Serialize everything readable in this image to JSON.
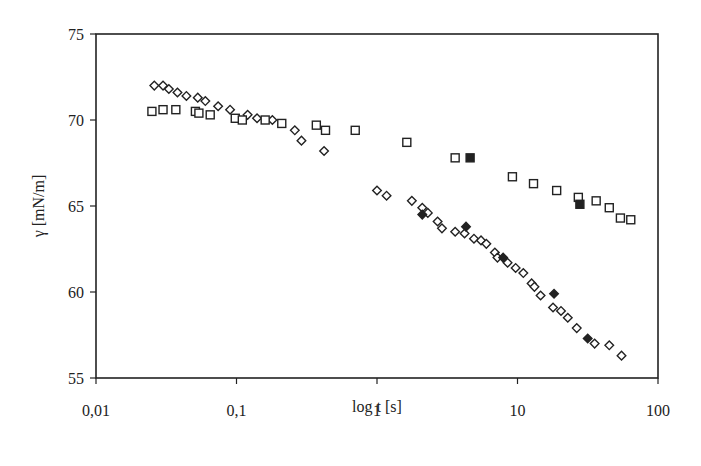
{
  "chart_data": {
    "type": "scatter",
    "title": "",
    "xlabel": "log t [s]",
    "ylabel": "γ [mN/m]",
    "xscale": "log",
    "xlim": [
      0.01,
      100
    ],
    "ylim": [
      55,
      75
    ],
    "x_ticks": [
      0.01,
      0.1,
      1,
      10,
      100
    ],
    "x_tick_labels": [
      "0,01",
      "0,1",
      "1",
      "10",
      "100"
    ],
    "y_ticks": [
      55,
      60,
      65,
      70,
      75
    ],
    "y_tick_labels": [
      "55",
      "60",
      "65",
      "70",
      "75"
    ],
    "grid": false,
    "legend": null,
    "series": [
      {
        "name": "open diamonds",
        "marker": "diamond-open",
        "x": [
          0.026,
          0.03,
          0.033,
          0.038,
          0.044,
          0.053,
          0.06,
          0.074,
          0.09,
          0.12,
          0.14,
          0.18,
          0.26,
          0.29,
          0.42,
          1.0,
          1.17,
          1.77,
          2.1,
          2.3,
          2.7,
          2.9,
          3.6,
          4.2,
          4.9,
          5.5,
          6.0,
          6.9,
          7.2,
          8.5,
          9.7,
          11.0,
          12.6,
          13.2,
          14.6,
          17.9,
          20.4,
          22.8,
          26.4,
          35.4,
          45,
          55
        ],
        "y": [
          72.0,
          72.0,
          71.8,
          71.6,
          71.4,
          71.3,
          71.1,
          70.8,
          70.6,
          70.3,
          70.1,
          70.0,
          69.4,
          68.8,
          68.2,
          65.9,
          65.6,
          65.3,
          64.9,
          64.6,
          64.1,
          63.7,
          63.5,
          63.4,
          63.1,
          63.0,
          62.8,
          62.3,
          62.0,
          61.7,
          61.4,
          61.1,
          60.5,
          60.3,
          59.8,
          59.1,
          58.9,
          58.5,
          57.9,
          57.0,
          56.9,
          56.3
        ]
      },
      {
        "name": "filled diamonds",
        "marker": "diamond-filled",
        "x": [
          2.1,
          4.3,
          7.9,
          18.2,
          31.6
        ],
        "y": [
          64.5,
          63.8,
          62.0,
          59.9,
          57.3
        ]
      },
      {
        "name": "open squares",
        "marker": "square-open",
        "x": [
          0.025,
          0.03,
          0.037,
          0.051,
          0.054,
          0.065,
          0.098,
          0.11,
          0.16,
          0.21,
          0.37,
          0.43,
          0.7,
          1.63,
          3.6,
          9.2,
          13.0,
          19.0,
          27.1,
          36.3,
          45,
          54,
          64
        ],
        "y": [
          70.5,
          70.6,
          70.6,
          70.5,
          70.4,
          70.3,
          70.1,
          70.0,
          70.0,
          69.8,
          69.7,
          69.4,
          69.4,
          68.7,
          67.8,
          66.7,
          66.3,
          65.9,
          65.5,
          65.3,
          64.9,
          64.3,
          64.2
        ]
      },
      {
        "name": "filled squares",
        "marker": "square-filled",
        "x": [
          4.6,
          27.8
        ],
        "y": [
          67.8,
          65.1
        ]
      }
    ]
  },
  "layout": {
    "plot_left": 96,
    "plot_right": 658,
    "plot_top": 34,
    "plot_bottom": 378,
    "marker_color": "#222222",
    "axis_color": "#222222"
  }
}
